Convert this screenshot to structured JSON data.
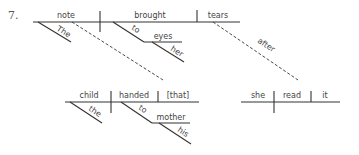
{
  "item_number": "7.",
  "main_clause": {
    "subject": "note",
    "verb": "brought",
    "object": "tears",
    "subject_modifier": "The",
    "verb_preposition": "to",
    "prep_object": "eyes",
    "prep_object_modifier": "her"
  },
  "relative_clause": {
    "subject": "child",
    "verb": "handed",
    "object": "[that]",
    "subject_modifier": "the",
    "verb_preposition": "to",
    "prep_object": "mother",
    "prep_object_modifier": "his"
  },
  "adverbial_clause": {
    "connector": "after",
    "subject": "she",
    "verb": "read",
    "object": "it"
  }
}
